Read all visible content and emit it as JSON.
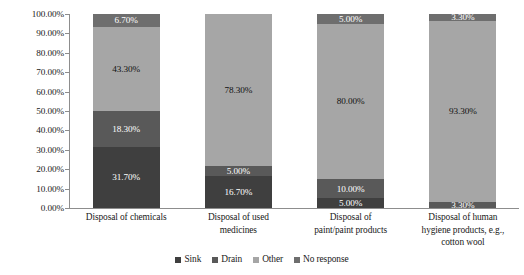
{
  "chart_data": {
    "type": "bar",
    "subtype": "stacked-bar-100-percent",
    "title": "",
    "xlabel": "",
    "ylabel": "",
    "ylim": [
      0,
      100
    ],
    "grid": false,
    "legend_position": "bottom",
    "y_tick_labels": [
      "100.00%",
      "90.00%",
      "80.00%",
      "70.00%",
      "60.00%",
      "50.00%",
      "40.00%",
      "30.00%",
      "20.00%",
      "10.00%",
      "0.00%"
    ],
    "y_tick_values": [
      100,
      90,
      80,
      70,
      60,
      50,
      40,
      30,
      20,
      10,
      0
    ],
    "categories": [
      "Disposal of chemicals",
      "Disposal of used medicines",
      "Disposal of paint/paint products",
      "Disposal of human hygiene products, e.g., cotton wool"
    ],
    "category_lines": [
      [
        "Disposal of chemicals"
      ],
      [
        "Disposal of used",
        "medicines"
      ],
      [
        "Disposal of",
        "paint/paint products"
      ],
      [
        "Disposal of human",
        "hygiene products, e.g.,",
        "cotton wool"
      ]
    ],
    "series": [
      {
        "name": "Sink",
        "color": "#3f3f3f",
        "values": [
          31.7,
          16.7,
          5.0,
          0
        ],
        "labels": [
          "31.70%",
          "16.70%",
          "5.00%",
          ""
        ],
        "label_colors": [
          "#ffffff",
          "#ffffff",
          "#ffffff",
          "#ffffff"
        ]
      },
      {
        "name": "Drain",
        "color": "#595959",
        "values": [
          18.3,
          5.0,
          10.0,
          3.3
        ],
        "labels": [
          "18.30%",
          "5.00%",
          "10.00%",
          "3.30%"
        ],
        "label_colors": [
          "#ffffff",
          "#ffffff",
          "#ffffff",
          "#ffffff"
        ]
      },
      {
        "name": "Other",
        "color": "#a6a6a6",
        "values": [
          43.3,
          78.3,
          80.0,
          93.3
        ],
        "labels": [
          "43.30%",
          "78.30%",
          "80.00%",
          "93.30%"
        ],
        "label_colors": [
          "#111111",
          "#111111",
          "#111111",
          "#111111"
        ]
      },
      {
        "name": "No response",
        "color": "#6e6e6e",
        "values": [
          6.7,
          0,
          5.0,
          3.3
        ],
        "labels": [
          "6.70%",
          "",
          "5.00%",
          "3.30%"
        ],
        "label_colors": [
          "#ffffff",
          "#ffffff",
          "#ffffff",
          "#ffffff"
        ]
      }
    ],
    "legend_entries": [
      {
        "label": "Sink",
        "color": "#3f3f3f"
      },
      {
        "label": "Drain",
        "color": "#595959"
      },
      {
        "label": "Other",
        "color": "#a6a6a6"
      },
      {
        "label": "No response",
        "color": "#6e6e6e"
      }
    ]
  }
}
